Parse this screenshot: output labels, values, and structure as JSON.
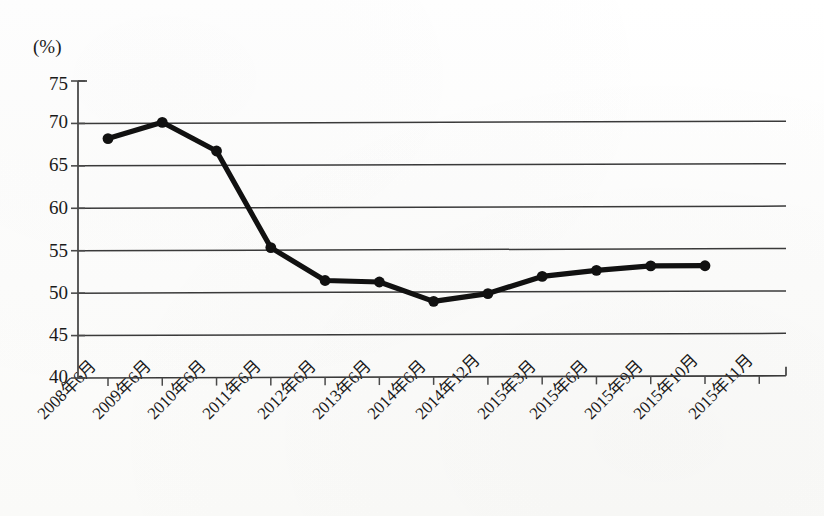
{
  "chart_data": {
    "type": "line",
    "title": "",
    "subtitle": "",
    "xlabel": "",
    "ylabel": "",
    "unit_label": "(%)",
    "categories": [
      "2008年6月",
      "2009年6月",
      "2010年6月",
      "2011年6月",
      "2012年6月",
      "2013年6月",
      "2014年6月",
      "2014年12月",
      "2015年3月",
      "2015年6月",
      "2015年9月",
      "2015年10月",
      "2015年11月"
    ],
    "values": [
      68.2,
      70.1,
      66.7,
      55.3,
      51.4,
      51.2,
      48.9,
      49.8,
      51.8,
      52.5,
      53.0,
      53.0,
      null
    ],
    "series": [
      {
        "name": "比率",
        "values": [
          68.2,
          70.1,
          66.7,
          55.3,
          51.4,
          51.2,
          48.9,
          49.8,
          51.8,
          52.5,
          53.0,
          53.0,
          null
        ]
      }
    ],
    "ylim": [
      40,
      75
    ],
    "yticks": [
      75,
      70,
      65,
      60,
      55,
      50,
      45,
      40
    ],
    "ytick_labels": [
      "75",
      "70",
      "65",
      "60",
      "55",
      "50",
      "45",
      "40"
    ],
    "gridlines": [
      70,
      65,
      60,
      55,
      50,
      45,
      40
    ],
    "grid": true,
    "legend": "none",
    "marker": "filled-circle",
    "line_color": "#111111",
    "grid_color": "#3a3a3a",
    "axis_color": "#4a4a4a"
  }
}
